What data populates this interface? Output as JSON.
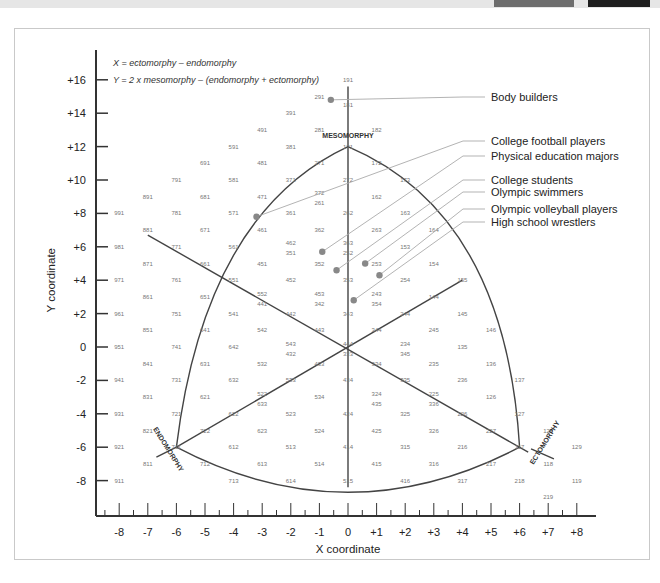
{
  "chart_data": {
    "type": "scatter",
    "formulas": [
      "X = ectomorphy – endomorphy",
      "Y = 2 x mesomorphy – (endomorphy + ectomorphy)"
    ],
    "xlabel": "X coordinate",
    "ylabel": "Y coordinate",
    "xlim": [
      -8,
      8
    ],
    "ylim": [
      -8,
      16
    ],
    "x_ticks": [
      "-8",
      "-7",
      "-6",
      "-5",
      "-4",
      "-3",
      "-2",
      "-1",
      "0",
      "+1",
      "+2",
      "+3",
      "+4",
      "+5",
      "+6",
      "+7",
      "+8"
    ],
    "y_ticks": [
      "+16",
      "+14",
      "+12",
      "+10",
      "+8",
      "+6",
      "+4",
      "+2",
      "0",
      "-2",
      "-4",
      "-6",
      "-8"
    ],
    "grid": false,
    "region_labels": [
      "MESOMORPHY",
      "ENDOMORPHY",
      "ECTOMORPHY"
    ],
    "series": [
      {
        "name": "Body builders",
        "x": -0.6,
        "y": 14.8
      },
      {
        "name": "College football players",
        "x": -3.2,
        "y": 7.8
      },
      {
        "name": "Physical education majors",
        "x": -0.9,
        "y": 5.7
      },
      {
        "name": "College students",
        "x": -0.4,
        "y": 4.6
      },
      {
        "name": "Olympic swimmers",
        "x": 0.6,
        "y": 5.0
      },
      {
        "name": "Olympic volleyball players",
        "x": 1.1,
        "y": 4.3
      },
      {
        "name": "High school wrestlers",
        "x": 0.2,
        "y": 2.8
      }
    ],
    "somatotype_grid_labels": [
      {
        "t": "191",
        "x": 0,
        "y": 16
      },
      {
        "t": "291",
        "x": -1,
        "y": 15
      },
      {
        "t": "181",
        "x": 0,
        "y": 14.5
      },
      {
        "t": "391",
        "x": -2,
        "y": 14
      },
      {
        "t": "281",
        "x": -1,
        "y": 13
      },
      {
        "t": "182",
        "x": 1,
        "y": 13
      },
      {
        "t": "491",
        "x": -3,
        "y": 13
      },
      {
        "t": "171",
        "x": 0,
        "y": 12
      },
      {
        "t": "591",
        "x": -4,
        "y": 12
      },
      {
        "t": "381",
        "x": -2,
        "y": 12
      },
      {
        "t": "691",
        "x": -5,
        "y": 11
      },
      {
        "t": "481",
        "x": -3,
        "y": 11
      },
      {
        "t": "271",
        "x": -1,
        "y": 11
      },
      {
        "t": "172",
        "x": 1,
        "y": 11
      },
      {
        "t": "791",
        "x": -6,
        "y": 10
      },
      {
        "t": "581",
        "x": -4,
        "y": 10
      },
      {
        "t": "371",
        "x": -2,
        "y": 10
      },
      {
        "t": "272",
        "x": 0,
        "y": 10
      },
      {
        "t": "173",
        "x": 2,
        "y": 10
      },
      {
        "t": "891",
        "x": -7,
        "y": 9
      },
      {
        "t": "681",
        "x": -5,
        "y": 9
      },
      {
        "t": "471",
        "x": -3,
        "y": 9
      },
      {
        "t": "372",
        "x": -1,
        "y": 9.2
      },
      {
        "t": "261",
        "x": -1,
        "y": 8.6
      },
      {
        "t": "162",
        "x": 1,
        "y": 9
      },
      {
        "t": "991",
        "x": -8,
        "y": 8
      },
      {
        "t": "781",
        "x": -6,
        "y": 8
      },
      {
        "t": "571",
        "x": -4,
        "y": 8
      },
      {
        "t": "361",
        "x": -2,
        "y": 8
      },
      {
        "t": "262",
        "x": 0,
        "y": 8
      },
      {
        "t": "163",
        "x": 2,
        "y": 8
      },
      {
        "t": "881",
        "x": -7,
        "y": 7
      },
      {
        "t": "671",
        "x": -5,
        "y": 7
      },
      {
        "t": "461",
        "x": -3,
        "y": 7
      },
      {
        "t": "362",
        "x": -1,
        "y": 7
      },
      {
        "t": "263",
        "x": 1,
        "y": 7
      },
      {
        "t": "164",
        "x": 3,
        "y": 7
      },
      {
        "t": "981",
        "x": -8,
        "y": 6
      },
      {
        "t": "771",
        "x": -6,
        "y": 6
      },
      {
        "t": "561",
        "x": -4,
        "y": 6
      },
      {
        "t": "462",
        "x": -2,
        "y": 6.2
      },
      {
        "t": "351",
        "x": -2,
        "y": 5.6
      },
      {
        "t": "363",
        "x": 0,
        "y": 6.2
      },
      {
        "t": "252",
        "x": 0,
        "y": 5.6
      },
      {
        "t": "153",
        "x": 2,
        "y": 6
      },
      {
        "t": "871",
        "x": -7,
        "y": 5
      },
      {
        "t": "661",
        "x": -5,
        "y": 5
      },
      {
        "t": "451",
        "x": -3,
        "y": 5
      },
      {
        "t": "352",
        "x": -1,
        "y": 5
      },
      {
        "t": "253",
        "x": 1,
        "y": 5
      },
      {
        "t": "154",
        "x": 3,
        "y": 5
      },
      {
        "t": "971",
        "x": -8,
        "y": 4
      },
      {
        "t": "761",
        "x": -6,
        "y": 4
      },
      {
        "t": "551",
        "x": -4,
        "y": 4
      },
      {
        "t": "452",
        "x": -2,
        "y": 4
      },
      {
        "t": "353",
        "x": 0,
        "y": 4
      },
      {
        "t": "254",
        "x": 2,
        "y": 4
      },
      {
        "t": "155",
        "x": 4,
        "y": 4
      },
      {
        "t": "861",
        "x": -7,
        "y": 3
      },
      {
        "t": "651",
        "x": -5,
        "y": 3
      },
      {
        "t": "552",
        "x": -3,
        "y": 3.2
      },
      {
        "t": "441",
        "x": -3,
        "y": 2.6
      },
      {
        "t": "453",
        "x": -1,
        "y": 3.2
      },
      {
        "t": "342",
        "x": -1,
        "y": 2.6
      },
      {
        "t": "243",
        "x": 1,
        "y": 3.2
      },
      {
        "t": "354",
        "x": 1,
        "y": 2.6
      },
      {
        "t": "144",
        "x": 3,
        "y": 3
      },
      {
        "t": "961",
        "x": -8,
        "y": 2
      },
      {
        "t": "751",
        "x": -6,
        "y": 2
      },
      {
        "t": "541",
        "x": -4,
        "y": 2
      },
      {
        "t": "442",
        "x": -2,
        "y": 2
      },
      {
        "t": "343",
        "x": 0,
        "y": 2
      },
      {
        "t": "244",
        "x": 2,
        "y": 2
      },
      {
        "t": "145",
        "x": 4,
        "y": 2
      },
      {
        "t": "851",
        "x": -7,
        "y": 1
      },
      {
        "t": "641",
        "x": -5,
        "y": 1
      },
      {
        "t": "542",
        "x": -3,
        "y": 1
      },
      {
        "t": "443",
        "x": -1,
        "y": 1
      },
      {
        "t": "344",
        "x": 1,
        "y": 1
      },
      {
        "t": "245",
        "x": 3,
        "y": 1
      },
      {
        "t": "146",
        "x": 5,
        "y": 1
      },
      {
        "t": "951",
        "x": -8,
        "y": 0
      },
      {
        "t": "741",
        "x": -6,
        "y": 0
      },
      {
        "t": "642",
        "x": -4,
        "y": 0
      },
      {
        "t": "543",
        "x": -2,
        "y": 0.2
      },
      {
        "t": "432",
        "x": -2,
        "y": -0.4
      },
      {
        "t": "444",
        "x": 0,
        "y": 0.2
      },
      {
        "t": "333",
        "x": 0,
        "y": -0.4
      },
      {
        "t": "234",
        "x": 2,
        "y": 0.2
      },
      {
        "t": "345",
        "x": 2,
        "y": -0.4
      },
      {
        "t": "135",
        "x": 4,
        "y": 0
      },
      {
        "t": "841",
        "x": -7,
        "y": -1
      },
      {
        "t": "631",
        "x": -5,
        "y": -1
      },
      {
        "t": "532",
        "x": -3,
        "y": -1
      },
      {
        "t": "433",
        "x": -1,
        "y": -1
      },
      {
        "t": "334",
        "x": 1,
        "y": -1
      },
      {
        "t": "235",
        "x": 3,
        "y": -1
      },
      {
        "t": "136",
        "x": 5,
        "y": -1
      },
      {
        "t": "941",
        "x": -8,
        "y": -2
      },
      {
        "t": "731",
        "x": -6,
        "y": -2
      },
      {
        "t": "632",
        "x": -4,
        "y": -2
      },
      {
        "t": "533",
        "x": -2,
        "y": -2
      },
      {
        "t": "434",
        "x": 0,
        "y": -2
      },
      {
        "t": "335",
        "x": 2,
        "y": -2
      },
      {
        "t": "236",
        "x": 4,
        "y": -2
      },
      {
        "t": "137",
        "x": 6,
        "y": -2
      },
      {
        "t": "831",
        "x": -7,
        "y": -3
      },
      {
        "t": "621",
        "x": -5,
        "y": -3
      },
      {
        "t": "522",
        "x": -3,
        "y": -2.8
      },
      {
        "t": "633",
        "x": -3,
        "y": -3.4
      },
      {
        "t": "534",
        "x": -1,
        "y": -3
      },
      {
        "t": "324",
        "x": 1,
        "y": -2.8
      },
      {
        "t": "435",
        "x": 1,
        "y": -3.4
      },
      {
        "t": "225",
        "x": 3,
        "y": -2.8
      },
      {
        "t": "336",
        "x": 3,
        "y": -3.4
      },
      {
        "t": "126",
        "x": 5,
        "y": -3
      },
      {
        "t": "931",
        "x": -8,
        "y": -4
      },
      {
        "t": "721",
        "x": -6,
        "y": -4
      },
      {
        "t": "622",
        "x": -4,
        "y": -4
      },
      {
        "t": "523",
        "x": -2,
        "y": -4
      },
      {
        "t": "424",
        "x": 0,
        "y": -4
      },
      {
        "t": "325",
        "x": 2,
        "y": -4
      },
      {
        "t": "226",
        "x": 4,
        "y": -4
      },
      {
        "t": "127",
        "x": 6,
        "y": -4
      },
      {
        "t": "821",
        "x": -7,
        "y": -5
      },
      {
        "t": "722",
        "x": -5,
        "y": -5
      },
      {
        "t": "623",
        "x": -3,
        "y": -5
      },
      {
        "t": "524",
        "x": -1,
        "y": -5
      },
      {
        "t": "425",
        "x": 1,
        "y": -5
      },
      {
        "t": "326",
        "x": 3,
        "y": -5
      },
      {
        "t": "227",
        "x": 5,
        "y": -5
      },
      {
        "t": "128",
        "x": 7,
        "y": -5
      },
      {
        "t": "921",
        "x": -8,
        "y": -6
      },
      {
        "t": "711",
        "x": -6,
        "y": -6
      },
      {
        "t": "612",
        "x": -4,
        "y": -6
      },
      {
        "t": "513",
        "x": -2,
        "y": -6
      },
      {
        "t": "414",
        "x": 0,
        "y": -6
      },
      {
        "t": "315",
        "x": 2,
        "y": -6
      },
      {
        "t": "216",
        "x": 4,
        "y": -6
      },
      {
        "t": "117",
        "x": 6,
        "y": -6
      },
      {
        "t": "129",
        "x": 8,
        "y": -6
      },
      {
        "t": "811",
        "x": -7,
        "y": -7
      },
      {
        "t": "712",
        "x": -5,
        "y": -7
      },
      {
        "t": "613",
        "x": -3,
        "y": -7
      },
      {
        "t": "514",
        "x": -1,
        "y": -7
      },
      {
        "t": "415",
        "x": 1,
        "y": -7
      },
      {
        "t": "316",
        "x": 3,
        "y": -7
      },
      {
        "t": "217",
        "x": 5,
        "y": -7
      },
      {
        "t": "118",
        "x": 7,
        "y": -7
      },
      {
        "t": "911",
        "x": -8,
        "y": -8
      },
      {
        "t": "713",
        "x": -4,
        "y": -8
      },
      {
        "t": "614",
        "x": -2,
        "y": -8
      },
      {
        "t": "515",
        "x": 0,
        "y": -8
      },
      {
        "t": "416",
        "x": 2,
        "y": -8
      },
      {
        "t": "317",
        "x": 4,
        "y": -8
      },
      {
        "t": "218",
        "x": 6,
        "y": -8
      },
      {
        "t": "119",
        "x": 8,
        "y": -8
      },
      {
        "t": "219",
        "x": 7,
        "y": -9
      }
    ]
  },
  "labels": {
    "formula_x": "X = ectomorphy – endomorphy",
    "formula_y": "Y = 2 x mesomorphy – (endomorphy + ectomorphy)",
    "x_title": "X coordinate",
    "y_title": "Y coordinate",
    "mesomorphy": "MESOMORPHY",
    "endomorphy": "ENDOMORPHY",
    "ectomorphy": "ECTOMORPHY"
  },
  "legend": [
    "Body builders",
    "College football players",
    "Physical education majors",
    "College students",
    "Olympic swimmers",
    "Olympic volleyball players",
    "High school wrestlers"
  ],
  "colors": {
    "axis": "#333333",
    "curve": "#444444",
    "leader": "#aaaaaa",
    "dot": "#888888",
    "numbers": "#777777"
  }
}
